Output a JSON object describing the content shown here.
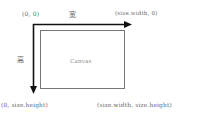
{
  "diagram": {
    "labels": {
      "origin": "(0, 0)",
      "width_axis": "宽",
      "height_axis": "高",
      "top_right": "(size.width, 0)",
      "bottom_left": "(0, size.height)",
      "bottom_right": "(size.width, size.height)",
      "canvas": "Canvas"
    },
    "colors": {
      "axis": "#111111",
      "canvas_border": "#666666",
      "text": "#666666",
      "background": "#ffffff"
    }
  }
}
